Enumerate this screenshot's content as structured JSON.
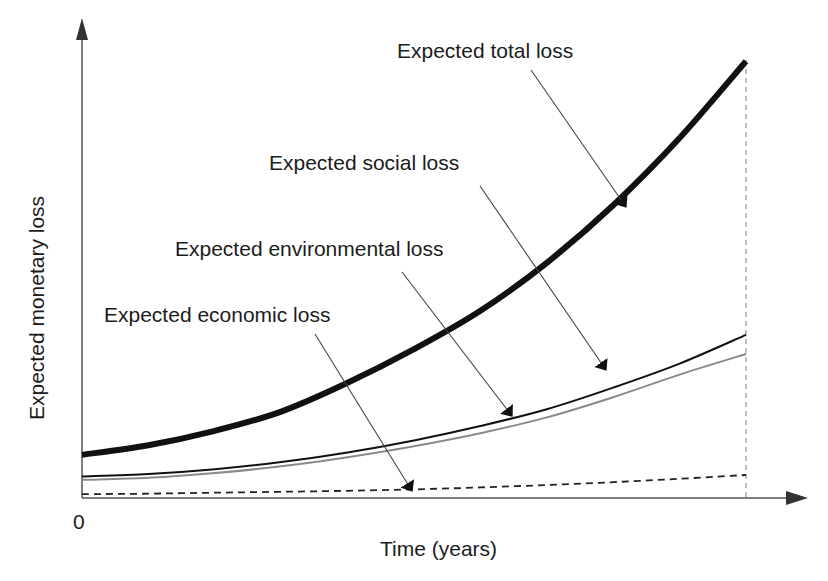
{
  "chart_data": {
    "type": "line",
    "title": "",
    "xlabel": "Time (years)",
    "ylabel": "Expected monetary loss",
    "x_tick_labels": [
      "0"
    ],
    "grid": false,
    "legend": "callout annotations with arrows",
    "x": [
      0,
      0.1,
      0.2,
      0.3,
      0.4,
      0.5,
      0.6,
      0.7,
      0.8,
      0.9,
      1.0
    ],
    "xlim": [
      0,
      1.0
    ],
    "ylim": [
      0,
      1.0
    ],
    "end_marker": {
      "x": 1.0,
      "style": "dotted vertical line"
    },
    "series": [
      {
        "name": "Expected total loss",
        "style": "thick solid black",
        "values": [
          0.09,
          0.11,
          0.14,
          0.18,
          0.24,
          0.31,
          0.39,
          0.49,
          0.61,
          0.75,
          0.91
        ]
      },
      {
        "name": "Expected social loss",
        "style": "thin solid black",
        "values": [
          0.045,
          0.05,
          0.06,
          0.075,
          0.095,
          0.12,
          0.15,
          0.185,
          0.23,
          0.28,
          0.34
        ]
      },
      {
        "name": "Expected environmental loss",
        "style": "thin solid gray",
        "values": [
          0.038,
          0.042,
          0.052,
          0.066,
          0.085,
          0.108,
          0.135,
          0.168,
          0.21,
          0.257,
          0.3
        ]
      },
      {
        "name": "Expected economic loss",
        "style": "dashed black",
        "values": [
          0.008,
          0.009,
          0.011,
          0.013,
          0.015,
          0.018,
          0.022,
          0.027,
          0.033,
          0.04,
          0.048
        ]
      }
    ],
    "annotations": [
      {
        "text": "Expected total loss",
        "points_to_series": "Expected total loss"
      },
      {
        "text": "Expected social loss",
        "points_to_series": "Expected social loss"
      },
      {
        "text": "Expected environmental loss",
        "points_to_series": "Expected social loss"
      },
      {
        "text": "Expected economic loss",
        "points_to_series": "Expected economic loss"
      }
    ]
  },
  "labels": {
    "xlabel": "Time (years)",
    "ylabel": "Expected monetary loss",
    "origin": "0",
    "total": "Expected total loss",
    "social": "Expected social loss",
    "environmental": "Expected environmental loss",
    "economic": "Expected economic loss"
  },
  "colors": {
    "axis": "#555555",
    "total": "#111111",
    "social": "#111111",
    "environmental": "#8a8a8a",
    "economic": "#222222",
    "arrow": "#444444",
    "endline": "#999999"
  }
}
